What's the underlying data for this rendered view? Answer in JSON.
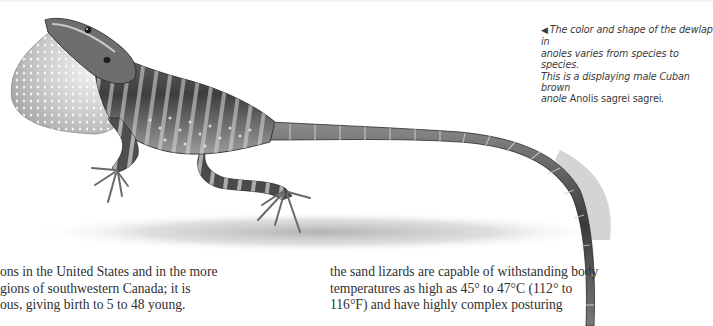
{
  "illustration": {
    "subject": "anole-lizard-with-dewlap",
    "style": "grayscale pencil illustration"
  },
  "caption": {
    "arrow": "◀",
    "text_before_species": "The color and shape of the dewlap in anoles varies from species to species. This is a displaying male Cuban brown anole",
    "lines": [
      "The color and shape of the dewlap in",
      "anoles varies from species to species.",
      "This is a displaying male Cuban brown",
      "anole "
    ],
    "species_name": "Anolis sagrei sagrei",
    "end_punct": "."
  },
  "body_text": {
    "left_column": {
      "lines": [
        "ons in the United States and in the more",
        "gions of southwestern Canada; it is",
        "ous, giving birth to 5 to 48 young."
      ]
    },
    "right_column": {
      "lines": [
        "the sand lizards are capable of withstanding body",
        "temperatures as high as 45° to 47°C (112° to",
        "116°F) and have highly complex posturing"
      ]
    }
  },
  "colors": {
    "background": "#ffffff",
    "text": "#2f2f2f",
    "caption_text": "#3a3a3a"
  }
}
